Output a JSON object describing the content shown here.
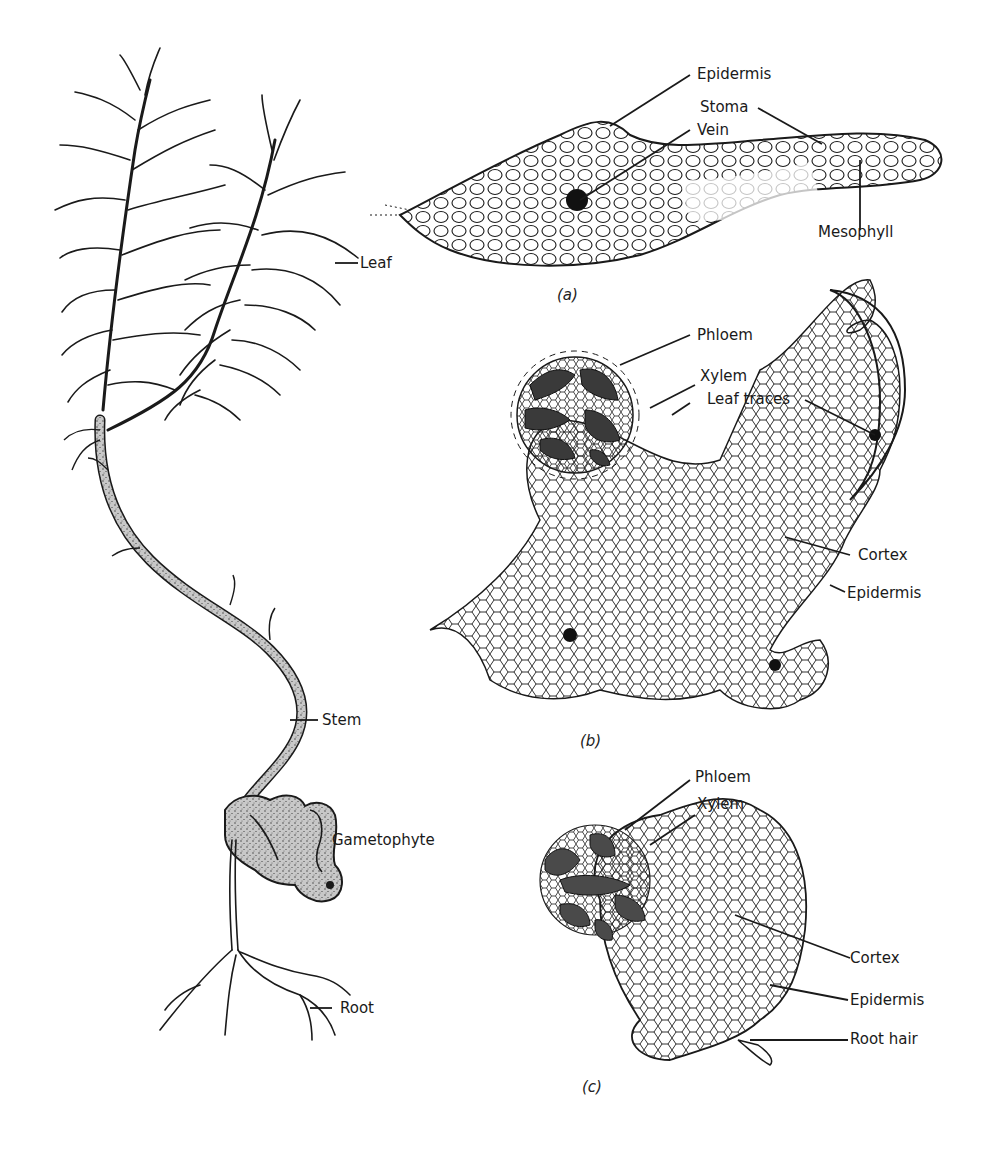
{
  "figure": {
    "plant": {
      "labels": {
        "leaf": "Leaf",
        "stem": "Stem",
        "gametophyte": "Gametophyte",
        "root": "Root"
      }
    },
    "panel_a": {
      "caption": "(a)",
      "subject": "leaf cross-section",
      "labels": {
        "epidermis": "Epidermis",
        "stoma": "Stoma",
        "vein": "Vein",
        "mesophyll": "Mesophyll"
      }
    },
    "panel_b": {
      "caption": "(b)",
      "subject": "stem cross-section",
      "labels": {
        "phloem": "Phloem",
        "xylem": "Xylem",
        "leaf_traces": "Leaf traces",
        "cortex": "Cortex",
        "epidermis": "Epidermis"
      }
    },
    "panel_c": {
      "caption": "(c)",
      "subject": "root cross-section",
      "labels": {
        "phloem": "Phloem",
        "xylem": "Xylem",
        "cortex": "Cortex",
        "epidermis": "Epidermis",
        "root_hair": "Root hair"
      }
    },
    "colors": {
      "ink": "#1a1a1a",
      "stem_fill": "#bdbdbd",
      "vascular_dark": "#3a3a3a",
      "vascular_mid": "#6a6a6a",
      "background": "#ffffff"
    }
  }
}
